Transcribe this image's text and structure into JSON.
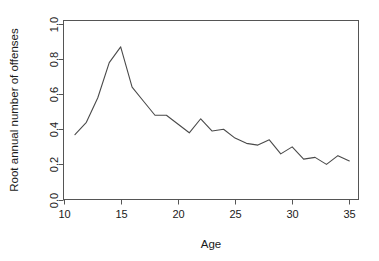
{
  "chart_data": {
    "type": "line",
    "title": "",
    "xlabel": "Age",
    "ylabel": "Root annual number of offenses",
    "xlim": [
      10,
      35.8
    ],
    "ylim": [
      0.0,
      1.02
    ],
    "xticks": [
      10,
      15,
      20,
      25,
      30,
      35
    ],
    "yticks": [
      0.0,
      0.2,
      0.4,
      0.6,
      0.8,
      1.0
    ],
    "xtick_labels": [
      "10",
      "15",
      "20",
      "25",
      "30",
      "35"
    ],
    "ytick_labels": [
      "0.0",
      "0.2",
      "0.4",
      "0.6",
      "0.8",
      "1.0"
    ],
    "grid": false,
    "legend": null,
    "legend_position": "none",
    "line_color": "#4a4a4a",
    "frame_color": "#555555",
    "x": [
      11,
      12,
      13,
      14,
      15,
      16,
      17,
      18,
      19,
      20,
      21,
      22,
      23,
      24,
      25,
      26,
      27,
      28,
      29,
      30,
      31,
      32,
      33,
      34,
      35
    ],
    "values": [
      0.37,
      0.44,
      0.58,
      0.78,
      0.87,
      0.64,
      0.56,
      0.48,
      0.48,
      0.43,
      0.38,
      0.46,
      0.39,
      0.4,
      0.35,
      0.32,
      0.31,
      0.34,
      0.26,
      0.3,
      0.23,
      0.24,
      0.2,
      0.25,
      0.22
    ],
    "series": [
      {
        "name": "Root annual number of offenses",
        "values": [
          0.37,
          0.44,
          0.58,
          0.78,
          0.87,
          0.64,
          0.56,
          0.48,
          0.48,
          0.43,
          0.38,
          0.46,
          0.39,
          0.4,
          0.35,
          0.32,
          0.31,
          0.34,
          0.26,
          0.3,
          0.23,
          0.24,
          0.2,
          0.25,
          0.22
        ]
      }
    ]
  }
}
